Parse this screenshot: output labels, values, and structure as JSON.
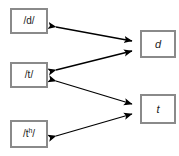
{
  "diagram": {
    "background_color": "#ffffff",
    "box_border_color": "#8a8a8a",
    "arrow_color": "#000000",
    "nodes": [
      {
        "id": "phoneme-d",
        "label": "/d/",
        "type": "phoneme",
        "column": "left",
        "x": 10,
        "y": 8
      },
      {
        "id": "phoneme-t",
        "label": "/t/",
        "type": "phoneme",
        "column": "left",
        "x": 10,
        "y": 62
      },
      {
        "id": "phoneme-th",
        "label_base": "/t",
        "label_sup": "h",
        "label_tail": "/",
        "label": "/tʰ/",
        "type": "phoneme",
        "column": "left",
        "x": 10,
        "y": 120
      },
      {
        "id": "phone-d",
        "label": "d",
        "type": "phone",
        "column": "right",
        "x": 140,
        "y": 30
      },
      {
        "id": "phone-t",
        "label": "t",
        "type": "phone",
        "column": "right",
        "x": 140,
        "y": 94
      }
    ],
    "edges": [
      {
        "id": "edge-phoneme-d-to-phone-d",
        "from": "phoneme-d",
        "to": "phone-d",
        "style": "double-headed"
      },
      {
        "id": "edge-phoneme-t-to-phone-d",
        "from": "phoneme-t",
        "to": "phone-d",
        "style": "double-headed"
      },
      {
        "id": "edge-phoneme-t-to-phone-t",
        "from": "phoneme-t",
        "to": "phone-t",
        "style": "double-headed"
      },
      {
        "id": "edge-phoneme-th-to-phone-t",
        "from": "phoneme-th",
        "to": "phone-t",
        "style": "double-headed"
      }
    ]
  }
}
